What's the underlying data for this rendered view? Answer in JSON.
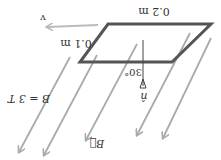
{
  "diagram": {
    "orientation": "rotated 180 degrees",
    "labels": {
      "width": "0.2 m",
      "height": "0.1 m",
      "velocity": "v",
      "normal": "n̂",
      "angle": "30°",
      "field_vector": "B⃗",
      "field_value": "B = 3 T"
    },
    "colors": {
      "loop": "#555555",
      "field_lines": "#aaaaaa",
      "velocity_arrow": "#bbbbbb",
      "normal_line": "#444444",
      "text": "#333333"
    }
  }
}
